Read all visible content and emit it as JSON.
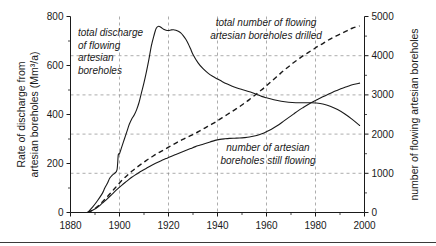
{
  "chart_data": {
    "type": "line",
    "title": "",
    "xlabel": "",
    "ylabel": "Rate of discharge from artesian boreholes (Mm³/a)",
    "y2label": "number of flowing artesian boreholes",
    "xlim": [
      1880,
      2000
    ],
    "ylim": [
      0,
      800
    ],
    "y2lim": [
      0,
      5000
    ],
    "xticks": [
      1880,
      1900,
      1920,
      1940,
      1960,
      1980,
      2000
    ],
    "xtick_labels": [
      "1880",
      "1900",
      "1920",
      "1940",
      "1960",
      "1980",
      "2000"
    ],
    "xminor_ticks": [
      1890,
      1910,
      1930,
      1950,
      1970,
      1990
    ],
    "yticks": [
      0,
      200,
      400,
      600,
      800
    ],
    "ytick_labels": [
      "0",
      "200",
      "400",
      "600",
      "800"
    ],
    "yminor_ticks": [
      100,
      300,
      500,
      700
    ],
    "y2ticks": [
      0,
      1000,
      2000,
      3000,
      4000,
      5000
    ],
    "y2tick_labels": [
      "0",
      "1000",
      "2000",
      "3000",
      "4000",
      "5000"
    ],
    "y2minor_ticks": [
      500,
      1500,
      2500,
      3500,
      4500
    ],
    "grid": true,
    "grid_x_values": [
      1900,
      1920,
      1940,
      1960,
      1980
    ],
    "grid_y2_values": [
      1000,
      2000,
      3000,
      4000
    ],
    "legend_position": "inline-annotations",
    "series": [
      {
        "name": "total discharge of flowing artesian boreholes",
        "axis": "left",
        "style": "solid",
        "units": "Mm3/a",
        "x": [
          1887,
          1889,
          1891,
          1893,
          1894,
          1895,
          1896,
          1897,
          1898,
          1899,
          1899.5,
          1900,
          1901,
          1902,
          1903,
          1904,
          1905,
          1906,
          1907,
          1908,
          1909,
          1910,
          1911,
          1912,
          1913,
          1914,
          1915,
          1916,
          1917,
          1918,
          1919,
          1920,
          1921,
          1922,
          1923,
          1924,
          1925,
          1926,
          1927,
          1928,
          1929,
          1930,
          1932,
          1934,
          1936,
          1938,
          1940,
          1942,
          1944,
          1946,
          1948,
          1950,
          1952,
          1954,
          1956,
          1958,
          1960,
          1963,
          1966,
          1969,
          1972,
          1975,
          1978,
          1980,
          1983,
          1986,
          1989,
          1992,
          1995,
          1998
        ],
        "y": [
          0,
          22,
          48,
          78,
          100,
          118,
          140,
          152,
          160,
          175,
          235,
          240,
          270,
          300,
          330,
          360,
          382,
          398,
          420,
          450,
          490,
          530,
          575,
          625,
          680,
          720,
          752,
          760,
          755,
          748,
          744,
          743,
          745,
          746,
          744,
          740,
          733,
          722,
          708,
          690,
          668,
          645,
          612,
          588,
          570,
          556,
          545,
          534,
          524,
          515,
          508,
          502,
          496,
          490,
          482,
          474,
          468,
          460,
          454,
          450,
          448,
          448,
          448,
          447,
          443,
          434,
          420,
          402,
          380,
          355
        ]
      },
      {
        "name": "total number of flowing artesian boreholes drilled",
        "axis": "right",
        "style": "dashed",
        "units": "boreholes",
        "x": [
          1887,
          1889,
          1891,
          1893,
          1895,
          1897,
          1899,
          1901,
          1903,
          1905,
          1907,
          1909,
          1911,
          1913,
          1915,
          1917,
          1919,
          1921,
          1923,
          1925,
          1927,
          1929,
          1931,
          1933,
          1935,
          1937,
          1939,
          1941,
          1943,
          1945,
          1947,
          1949,
          1951,
          1953,
          1955,
          1957,
          1959,
          1961,
          1963,
          1965,
          1967,
          1969,
          1971,
          1973,
          1975,
          1977,
          1979,
          1981,
          1983,
          1985,
          1987,
          1989,
          1991,
          1993,
          1995,
          1998
        ],
        "y": [
          0,
          60,
          150,
          270,
          400,
          540,
          680,
          820,
          940,
          1050,
          1150,
          1240,
          1330,
          1410,
          1490,
          1560,
          1630,
          1700,
          1770,
          1840,
          1900,
          1960,
          2020,
          2090,
          2160,
          2230,
          2300,
          2380,
          2460,
          2540,
          2620,
          2700,
          2790,
          2880,
          2980,
          3080,
          3180,
          3290,
          3400,
          3510,
          3620,
          3720,
          3820,
          3910,
          4000,
          4080,
          4160,
          4240,
          4310,
          4390,
          4460,
          4520,
          4580,
          4640,
          4700,
          4760
        ]
      },
      {
        "name": "number of artesian boreholes still flowing",
        "axis": "right",
        "style": "solid",
        "units": "boreholes",
        "x": [
          1887,
          1889,
          1891,
          1893,
          1895,
          1897,
          1899,
          1901,
          1903,
          1905,
          1907,
          1909,
          1911,
          1913,
          1915,
          1917,
          1919,
          1921,
          1923,
          1925,
          1927,
          1929,
          1931,
          1933,
          1935,
          1937,
          1939,
          1941,
          1943,
          1945,
          1947,
          1949,
          1951,
          1953,
          1955,
          1957,
          1959,
          1961,
          1963,
          1965,
          1967,
          1969,
          1971,
          1973,
          1975,
          1977,
          1979,
          1981,
          1983,
          1985,
          1987,
          1989,
          1991,
          1993,
          1995,
          1998
        ],
        "y": [
          0,
          55,
          130,
          240,
          350,
          470,
          590,
          700,
          800,
          900,
          980,
          1060,
          1130,
          1200,
          1260,
          1320,
          1375,
          1430,
          1480,
          1530,
          1580,
          1630,
          1680,
          1720,
          1760,
          1800,
          1840,
          1865,
          1880,
          1890,
          1895,
          1900,
          1910,
          1925,
          1950,
          1985,
          2030,
          2090,
          2160,
          2240,
          2330,
          2420,
          2510,
          2600,
          2680,
          2755,
          2825,
          2890,
          2950,
          3010,
          3070,
          3120,
          3170,
          3215,
          3260,
          3300
        ]
      }
    ],
    "annotations": [
      {
        "id": "annotation-total-discharge",
        "lines": [
          "total discharge",
          "of flowing",
          "artesian",
          "boreholes"
        ],
        "x": 78,
        "y": 36,
        "align": "start"
      },
      {
        "id": "annotation-total-drilled",
        "lines": [
          "total number of flowing",
          "artesian boreholes drilled"
        ],
        "x": 266,
        "y": 26,
        "align": "middle"
      },
      {
        "id": "annotation-still-flowing",
        "lines": [
          "number of artesian",
          "boreholes still flowing"
        ],
        "x": 268,
        "y": 151,
        "align": "middle"
      }
    ]
  },
  "colors": {
    "ink": "#1a1a1a",
    "grid": "#8a8a8a",
    "background": "#ffffff"
  }
}
